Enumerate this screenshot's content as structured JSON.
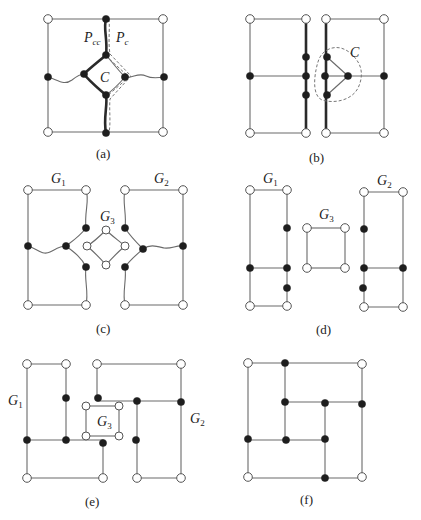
{
  "figure": {
    "panels": [
      {
        "id": "a",
        "caption": "(a)",
        "labels": {
          "pcc": "P",
          "pcc_sub": "cc",
          "pc": "P",
          "pc_sub": "c",
          "cycle": "C"
        }
      },
      {
        "id": "b",
        "caption": "(b)",
        "labels": {
          "cycle": "C"
        }
      },
      {
        "id": "c",
        "caption": "(c)",
        "labels": {
          "g1": "G",
          "g1_sub": "1",
          "g2": "G",
          "g2_sub": "2",
          "g3": "G",
          "g3_sub": "3"
        }
      },
      {
        "id": "d",
        "caption": "(d)",
        "labels": {
          "g1": "G",
          "g1_sub": "1",
          "g2": "G",
          "g2_sub": "2",
          "g3": "G",
          "g3_sub": "3"
        }
      },
      {
        "id": "e",
        "caption": "(e)",
        "labels": {
          "g1": "G",
          "g1_sub": "1",
          "g2": "G",
          "g2_sub": "2",
          "g3": "G",
          "g3_sub": "3"
        }
      },
      {
        "id": "f",
        "caption": "(f)",
        "labels": {}
      }
    ],
    "legend": {
      "open_vertex": "corner vertex (hollow circle)",
      "filled_vertex": "internal vertex (filled circle)",
      "thick_edge": "path P_cc",
      "dashed_edge": "path P_c / cycle region C"
    },
    "colors": {
      "edge": "#6a6a6a",
      "thick_edge": "#2a2a2a",
      "filled_vertex": "#1e1e1e",
      "open_vertex_fill": "#ffffff"
    }
  }
}
